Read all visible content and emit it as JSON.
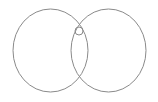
{
  "diagram": {
    "type": "venn",
    "stroke_color": "#8a8a8a",
    "background": "#ffffff",
    "shapes": [
      {
        "name": "left-circle",
        "cx": 50.5,
        "cy": 50.5,
        "rx": 37.5,
        "ry": 41.5
      },
      {
        "name": "right-circle",
        "cx": 108.5,
        "cy": 50.5,
        "rx": 37.5,
        "ry": 41.5
      },
      {
        "name": "small-circle",
        "cx": 79,
        "cy": 31,
        "rx": 4,
        "ry": 4
      }
    ]
  }
}
